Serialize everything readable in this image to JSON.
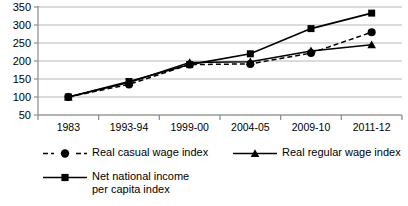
{
  "chart_data": {
    "type": "line",
    "title": "",
    "subtitle": "",
    "xlabel": "",
    "ylabel": "",
    "categories": [
      "1983",
      "1993-94",
      "1999-00",
      "2004-05",
      "2009-10",
      "2011-12"
    ],
    "ylim": [
      50,
      350
    ],
    "yticks": [
      50,
      100,
      150,
      200,
      250,
      300,
      350
    ],
    "ytick_labels": [
      "50",
      "100",
      "150",
      "200",
      "250",
      "300",
      "350"
    ],
    "grid": true,
    "legend_position": "bottom",
    "series": [
      {
        "name": "Real casual wage index",
        "marker": "circle",
        "line_style": "dashed",
        "color": "#000000",
        "values": [
          100,
          135,
          190,
          192,
          222,
          280
        ]
      },
      {
        "name": "Real regular wage index",
        "marker": "triangle",
        "line_style": "solid",
        "color": "#000000",
        "values": [
          100,
          140,
          196,
          198,
          228,
          245
        ]
      },
      {
        "name": "Net national income\nper capita index",
        "marker": "square",
        "line_style": "solid",
        "color": "#000000",
        "values": [
          100,
          143,
          190,
          220,
          290,
          333
        ]
      }
    ]
  },
  "legend": {
    "entries": [
      {
        "label": "Real casual wage index"
      },
      {
        "label": "Real regular wage index"
      },
      {
        "label": "Net national income\nper capita index"
      }
    ]
  },
  "colors": {
    "ink": "#000000",
    "gridline": "#b9b9b9",
    "axis": "#8a8a8a",
    "background": "#ffffff"
  }
}
